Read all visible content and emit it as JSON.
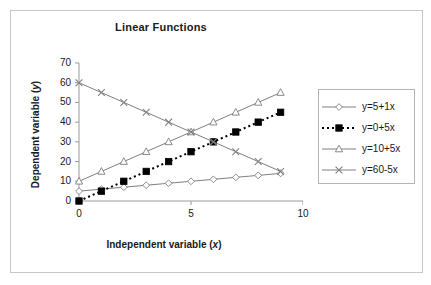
{
  "chart_data": {
    "type": "line",
    "title": "Linear Functions",
    "xlabel": "Independent variable (x)",
    "ylabel": "Dependent variable (y)",
    "xlabel_plain": "Independent variable",
    "xlabel_italic": "x",
    "ylabel_plain": "Dependent variable",
    "ylabel_italic": "y",
    "x": [
      0,
      1,
      2,
      3,
      4,
      5,
      6,
      7,
      8,
      9
    ],
    "xlim": [
      0,
      10
    ],
    "ylim": [
      0,
      70
    ],
    "xticks": [
      0,
      5,
      10
    ],
    "xtick_labels": [
      "0",
      "5",
      "10"
    ],
    "yticks": [
      0,
      10,
      20,
      30,
      40,
      50,
      60,
      70
    ],
    "ytick_labels": [
      "0",
      "10",
      "20",
      "30",
      "40",
      "50",
      "60",
      "70"
    ],
    "grid": false,
    "legend_position": "right",
    "series": [
      {
        "name": "y=5+1x",
        "marker": "open-diamond",
        "line_style": "solid",
        "color": "#808080",
        "values": [
          5,
          6,
          7,
          8,
          9,
          10,
          11,
          12,
          13,
          14
        ]
      },
      {
        "name": "y=0+5x",
        "marker": "filled-square",
        "line_style": "dotted",
        "color": "#000000",
        "values": [
          0,
          5,
          10,
          15,
          20,
          25,
          30,
          35,
          40,
          45
        ]
      },
      {
        "name": "y=10+5x",
        "marker": "open-triangle",
        "line_style": "solid",
        "color": "#808080",
        "values": [
          10,
          15,
          20,
          25,
          30,
          35,
          40,
          45,
          50,
          55
        ]
      },
      {
        "name": "y=60-5x",
        "marker": "cross-x",
        "line_style": "solid",
        "color": "#808080",
        "values": [
          60,
          55,
          50,
          45,
          40,
          35,
          30,
          25,
          20,
          15
        ]
      }
    ]
  },
  "legend": {
    "items": [
      {
        "label": "y=5+1x"
      },
      {
        "label": "y=0+5x"
      },
      {
        "label": "y=10+5x"
      },
      {
        "label": "y=60-5x"
      }
    ]
  },
  "axes": {
    "y_tick_labels": [
      "70",
      "60",
      "50",
      "40",
      "30",
      "20",
      "10",
      "0"
    ],
    "x_tick_labels": [
      "0",
      "5",
      "10"
    ]
  }
}
